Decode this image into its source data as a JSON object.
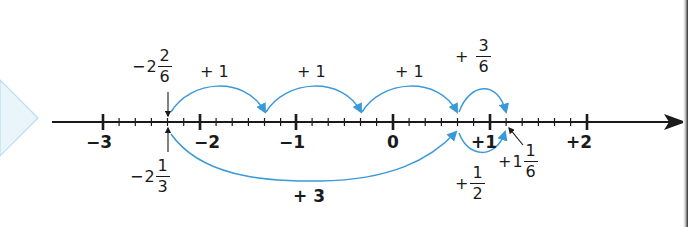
{
  "number_line": {
    "min": -3,
    "max": 2,
    "subdivisions_per_unit": 6,
    "axis_color": "#1a1a1a",
    "arc_color": "#3a9ad9",
    "pointer_triangle_fill": "#eaf5fb",
    "pointer_triangle_stroke": "#b9dcf0",
    "tick_labels": [
      "-3",
      "-2",
      "-1",
      "0",
      "+1",
      "+2"
    ],
    "tick_label_text": {
      "m3": "−3",
      "m2": "−2",
      "m1": "−1",
      "z": "0",
      "p1": "+1",
      "p2": "+2"
    }
  },
  "top_path": {
    "start_label": {
      "sign": "−",
      "whole": "2",
      "num": "2",
      "den": "6"
    },
    "jumps": [
      {
        "label": "+ 1",
        "from": "-2 2/6",
        "to": "-1 2/6"
      },
      {
        "label": "+ 1",
        "from": "-1 2/6",
        "to": "-2/6"
      },
      {
        "label": "+ 1",
        "from": "-2/6",
        "to": "4/6"
      },
      {
        "label_sign": "+",
        "label_num": "3",
        "label_den": "6",
        "from": "4/6",
        "to": "1 1/6"
      }
    ],
    "labels": {
      "jump1": "+ 1",
      "jump2": "+ 1",
      "jump3": "+ 1",
      "jump4_sign": "+",
      "jump4_num": "3",
      "jump4_den": "6"
    }
  },
  "bottom_path": {
    "start_label": {
      "sign": "−",
      "whole": "2",
      "num": "1",
      "den": "3"
    },
    "jumps": [
      {
        "label": "+ 3",
        "from": "-2 1/3",
        "to": "2/3"
      },
      {
        "label_sign": "+",
        "label_num": "1",
        "label_den": "2",
        "from": "2/3",
        "to": "1 1/6"
      }
    ],
    "labels": {
      "jump1": "+ 3",
      "jump2_sign": "+",
      "jump2_num": "1",
      "jump2_den": "2"
    }
  },
  "result_label": {
    "sign": "+",
    "whole": "1",
    "num": "1",
    "den": "6"
  }
}
